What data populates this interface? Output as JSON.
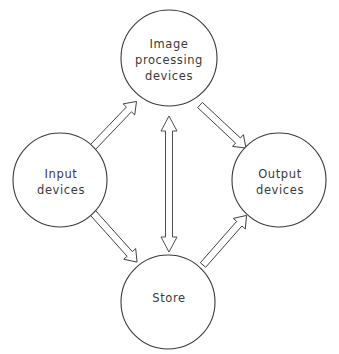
{
  "diagram": {
    "type": "block-flow",
    "line_color": "#3a3a3a",
    "background": "#ffffff",
    "nodes": [
      {
        "id": "processing",
        "lines": [
          "Image",
          "processing",
          "devices"
        ],
        "cx": 169,
        "cy": 58,
        "r": 48
      },
      {
        "id": "input",
        "lines": [
          "Input",
          "devices"
        ],
        "cx": 60,
        "cy": 180,
        "r": 47
      },
      {
        "id": "output",
        "lines": [
          "Output",
          "devices"
        ],
        "cx": 279,
        "cy": 180,
        "r": 47
      },
      {
        "id": "store",
        "lines": [
          "Store"
        ],
        "cx": 168,
        "cy": 302,
        "r": 47
      }
    ],
    "edges": [
      {
        "from": "input",
        "to": "processing",
        "direction": "one-way"
      },
      {
        "from": "processing",
        "to": "output",
        "direction": "one-way"
      },
      {
        "from": "input",
        "to": "store",
        "direction": "one-way"
      },
      {
        "from": "store",
        "to": "output",
        "direction": "one-way"
      },
      {
        "from": "processing",
        "to": "store",
        "direction": "two-way"
      }
    ]
  }
}
